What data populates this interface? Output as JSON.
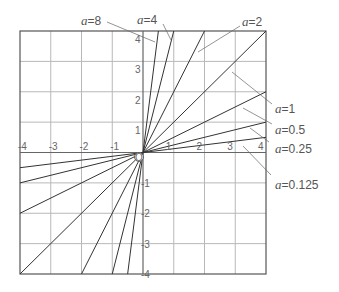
{
  "diagram": {
    "title": "",
    "grid": {
      "xmin": -4,
      "xmax": 4,
      "ymin": -4,
      "ymax": 4,
      "step": 1
    },
    "origin_label": "O",
    "x_ticks": [
      "-4",
      "-3",
      "-2",
      "-1",
      "1",
      "2",
      "3",
      "4"
    ],
    "y_ticks": [
      "4",
      "3",
      "2",
      "1",
      "-1",
      "-2",
      "-3",
      "-4"
    ],
    "lines": [
      {
        "a": 8,
        "label_var": "a",
        "label_value": "=8"
      },
      {
        "a": 4,
        "label_var": "a",
        "label_value": "=4"
      },
      {
        "a": 2,
        "label_var": "a",
        "label_value": "=2"
      },
      {
        "a": 1,
        "label_var": "a",
        "label_value": "=1"
      },
      {
        "a": 0.5,
        "label_var": "a",
        "label_value": "=0.5"
      },
      {
        "a": 0.25,
        "label_var": "a",
        "label_value": "=0.25"
      },
      {
        "a": 0.125,
        "label_var": "a",
        "label_value": "=0.125"
      }
    ],
    "equation_form": "y = a x"
  }
}
